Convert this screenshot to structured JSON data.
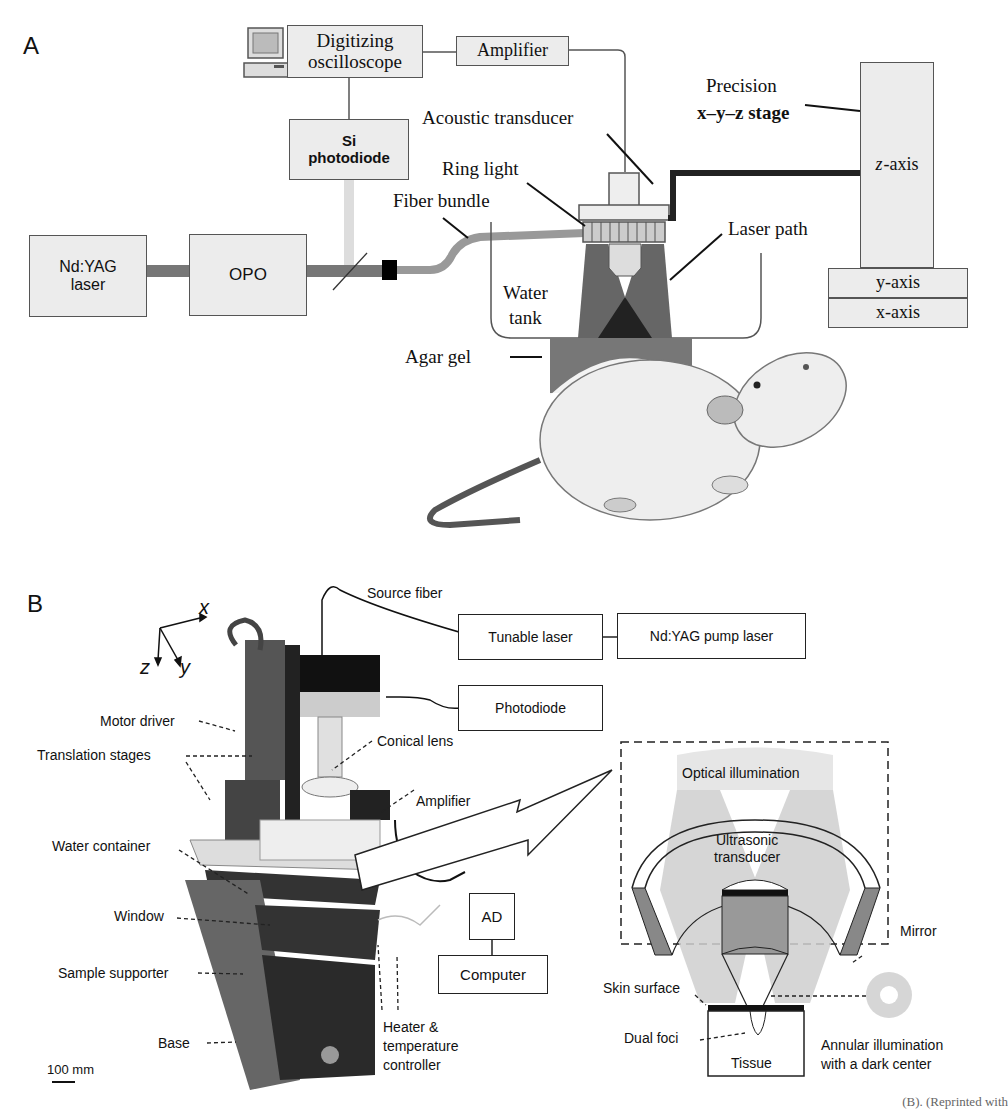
{
  "panel_a": {
    "letter": "A",
    "boxes": {
      "digitizing_oscilloscope": [
        "Digitizing",
        "oscilloscope"
      ],
      "amplifier": "Amplifier",
      "si_photodiode": [
        "Si",
        "photodiode"
      ],
      "ndyag_laser": [
        "Nd:YAG",
        "laser"
      ],
      "opo": "OPO",
      "z_axis": "z-axis",
      "y_axis": "y-axis",
      "x_axis": "x-axis"
    },
    "labels": {
      "acoustic_transducer": "Acoustic transducer",
      "ring_light": "Ring light",
      "fiber_bundle": "Fiber bundle",
      "precision_stage_line1": "Precision",
      "precision_stage_line2": "x–y–z stage",
      "laser_path": "Laser path",
      "water_tank_line1": "Water",
      "water_tank_line2": "tank",
      "agar_gel": "Agar gel"
    },
    "icons": [
      "computer-icon",
      "rat-illustration"
    ]
  },
  "panel_b": {
    "letter": "B",
    "axes": {
      "x": "x",
      "y": "y",
      "z": "z"
    },
    "boxes": {
      "tunable_laser": "Tunable laser",
      "ndyag_pump_laser": "Nd:YAG pump laser",
      "photodiode": "Photodiode",
      "ad": "AD",
      "computer": "Computer"
    },
    "photo_labels": {
      "source_fiber": "Source fiber",
      "motor_driver": "Motor driver",
      "translation_stages": "Translation stages",
      "conical_lens": "Conical lens",
      "amplifier": "Amplifier",
      "water_container": "Water container",
      "window": "Window",
      "sample_supporter": "Sample supporter",
      "base": "Base",
      "heater_line1": "Heater &",
      "heater_line2": "temperature",
      "heater_line3": "controller",
      "scale_bar": "100 mm"
    },
    "inset_labels": {
      "optical_illumination": "Optical illumination",
      "ultrasonic_line1": "Ultrasonic",
      "ultrasonic_line2": "transducer",
      "mirror": "Mirror",
      "skin_surface": "Skin surface",
      "dual_foci": "Dual foci",
      "tissue": "Tissue",
      "annular_line1": "Annular illumination",
      "annular_line2": "with a dark center"
    }
  },
  "caption_fragment": "(B). (Reprinted with"
}
